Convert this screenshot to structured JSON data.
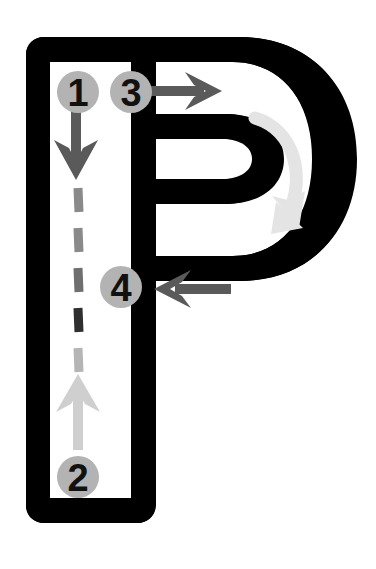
{
  "figure": {
    "letter": "P",
    "letter_color": "#000000",
    "background_color": "#ffffff",
    "counter_color": "#ffffff"
  },
  "palette": {
    "badge_fill": "#b3b3b3",
    "badge_fill_light": "#bdbdbd",
    "badge_text": "#111111",
    "arrow_dark": "#5a5a5a",
    "arrow_mid": "#8f8f8f",
    "arrow_light": "#c9c9c9",
    "arrow_faint": "#e0e0e0",
    "dash_dark": "#3a3a3a",
    "dash_mid": "#8a8a8a",
    "dash_light": "#c2c2c2"
  },
  "steps": [
    {
      "id": "step-1",
      "number": "1",
      "cx": 78,
      "cy": 92,
      "r": 21,
      "description": "Start at top of stem, stroke downward"
    },
    {
      "id": "step-2",
      "number": "2",
      "cx": 78,
      "cy": 477,
      "r": 21,
      "description": "End of stem at baseline"
    },
    {
      "id": "step-3",
      "number": "3",
      "cx": 131,
      "cy": 92,
      "r": 21,
      "description": "Start bowl at top, stroke to the right"
    },
    {
      "id": "step-4",
      "number": "4",
      "cx": 121,
      "cy": 287,
      "r": 21,
      "description": "Close bowl back to the stem"
    }
  ],
  "arrows": [
    {
      "id": "arrow-down-stem",
      "name": "down-arrow",
      "direction": "down",
      "color": "#5a5a5a",
      "step": "1"
    },
    {
      "id": "arrow-up-stem",
      "name": "up-arrow",
      "direction": "up",
      "color": "#cfcfcf",
      "step": "2"
    },
    {
      "id": "arrow-right-top",
      "name": "right-arrow",
      "direction": "right",
      "color": "#5a5a5a",
      "step": "3"
    },
    {
      "id": "arrow-left-bowl",
      "name": "left-arrow",
      "direction": "left",
      "color": "#5a5a5a",
      "step": "4"
    },
    {
      "id": "arrow-curve-bowl",
      "name": "curved-arrow",
      "direction": "clockwise",
      "color": "#e4e4e4",
      "step": "3"
    }
  ],
  "dashes": {
    "name": "dashed-stroke-path",
    "x": 78,
    "segments": [
      {
        "y1": 188,
        "y2": 212,
        "color": "#8a8a8a"
      },
      {
        "y1": 228,
        "y2": 252,
        "color": "#8a8a8a"
      },
      {
        "y1": 268,
        "y2": 292,
        "color": "#6f6f6f"
      },
      {
        "y1": 308,
        "y2": 332,
        "color": "#2f2f2f"
      },
      {
        "y1": 348,
        "y2": 372,
        "color": "#b5b5b5"
      }
    ]
  }
}
